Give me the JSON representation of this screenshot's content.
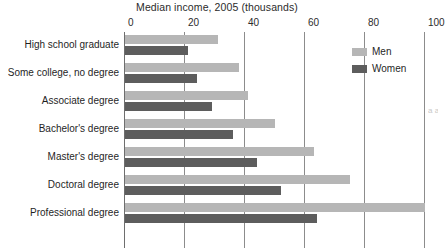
{
  "chart_data": {
    "type": "bar",
    "orientation": "horizontal",
    "title": "Median income, 2005 (thousands)",
    "xlabel": "",
    "ylabel": "",
    "xlim": [
      0,
      100
    ],
    "xticks": [
      0,
      20,
      40,
      60,
      80,
      100
    ],
    "xtick_labels": [
      "0",
      "20",
      "40",
      "60",
      "80",
      "100"
    ],
    "grid": true,
    "grid_axis": "x",
    "legend_position": "top-right",
    "categories": [
      "High school graduate",
      "Some college, no degree",
      "Associate degree",
      "Bachelor's degree",
      "Master's degree",
      "Doctoral degree",
      "Professional degree"
    ],
    "series": [
      {
        "name": "Men",
        "color": "#b6b6b6",
        "values": [
          31,
          38,
          41,
          50,
          63,
          75,
          100
        ]
      },
      {
        "name": "Women",
        "color": "#5d5d5d",
        "values": [
          21,
          24,
          29,
          36,
          44,
          52,
          64
        ]
      }
    ]
  },
  "legend": {
    "items": [
      {
        "label": "Men",
        "color": "#b6b6b6"
      },
      {
        "label": "Women",
        "color": "#5d5d5d"
      }
    ]
  },
  "edge_text": "a a l a a a a"
}
